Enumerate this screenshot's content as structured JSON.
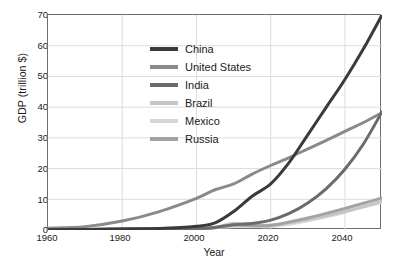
{
  "chart_data": {
    "type": "line",
    "title": "",
    "xlabel": "Year",
    "ylabel": "GDP (trillion $)",
    "xlim": [
      1960,
      2050
    ],
    "ylim": [
      0,
      70
    ],
    "grid": true,
    "legend_position": "upper-center",
    "xticks": [
      "1960",
      "1980",
      "2000",
      "2020",
      "2040"
    ],
    "yticks": [
      "0",
      "10",
      "20",
      "30",
      "40",
      "50",
      "60",
      "70"
    ],
    "x": [
      1960,
      1970,
      1980,
      1990,
      2000,
      2005,
      2010,
      2015,
      2020,
      2025,
      2030,
      2035,
      2040,
      2045,
      2050
    ],
    "series": [
      {
        "name": "China",
        "color": "#3a3a3a",
        "values": [
          0.1,
          0.2,
          0.4,
          0.5,
          1.2,
          2.3,
          6.0,
          11.0,
          15.0,
          22.0,
          31.0,
          40.0,
          49.0,
          59.0,
          70.0
        ]
      },
      {
        "name": "United States",
        "color": "#8a8a8a",
        "values": [
          0.6,
          1.1,
          2.9,
          6.0,
          10.3,
          13.1,
          15.0,
          18.2,
          21.0,
          23.6,
          26.4,
          29.2,
          32.1,
          35.0,
          38.2
        ]
      },
      {
        "name": "India",
        "color": "#6b6b6b",
        "values": [
          0.04,
          0.06,
          0.19,
          0.32,
          0.48,
          0.83,
          1.7,
          2.1,
          3.2,
          5.4,
          8.8,
          13.5,
          19.8,
          28.0,
          38.5
        ]
      },
      {
        "name": "Brazil",
        "color": "#c6c6c6",
        "values": [
          0.02,
          0.04,
          0.15,
          0.46,
          0.65,
          0.89,
          2.2,
          1.8,
          1.6,
          2.4,
          3.4,
          4.6,
          6.0,
          7.6,
          9.4
        ]
      },
      {
        "name": "Mexico",
        "color": "#d6d6d6",
        "values": [
          0.01,
          0.04,
          0.22,
          0.29,
          0.71,
          0.88,
          1.1,
          1.2,
          1.1,
          1.9,
          3.0,
          4.3,
          5.8,
          7.5,
          9.0
        ]
      },
      {
        "name": "Russia",
        "color": "#a3a3a3",
        "values": [
          0.0,
          0.0,
          0.0,
          0.52,
          0.26,
          0.76,
          1.6,
          1.4,
          1.5,
          2.6,
          3.9,
          5.4,
          7.0,
          8.7,
          10.4
        ]
      }
    ],
    "axis_color": "#6e6e6e",
    "grid_color": "#dcdcdc",
    "background": "#ffffff"
  }
}
